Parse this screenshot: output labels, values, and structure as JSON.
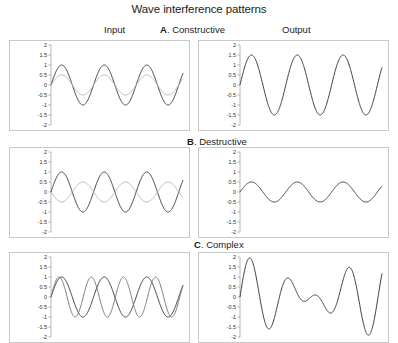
{
  "figure": {
    "title": "Wave interference patterns"
  },
  "headers": {
    "input": "Input",
    "output": "Output"
  },
  "panels": [
    {
      "id": "a",
      "letter": "A",
      "separator": ". ",
      "name": "Constructive"
    },
    {
      "id": "b",
      "letter": "B",
      "separator": ". ",
      "name": "Destructive"
    },
    {
      "id": "c",
      "letter": "C",
      "separator": ". ",
      "name": "Complex"
    }
  ],
  "colors": {
    "wave_dark": "#3d3d3d",
    "wave_light": "#b8b8b8",
    "frame": "#c9c9c9",
    "axis": "#9a9a9a",
    "background": "#ffffff",
    "text": "#1c1c1c"
  },
  "chart_data": [
    {
      "type": "line",
      "title": "A. Constructive — Input",
      "panel": "A",
      "column": "Input",
      "xlabel": "",
      "ylabel": "",
      "ylim": [
        -2,
        2
      ],
      "yticks": [
        2,
        1.5,
        1,
        0.5,
        0,
        -0.5,
        -1,
        -1.5,
        -2
      ],
      "ytick_labels": [
        "2",
        "1.5",
        "1",
        "0.5",
        "0",
        "-0.5",
        "-1",
        "-1.5",
        "-2"
      ],
      "grid": false,
      "legend": "none",
      "xlim": [
        0,
        3.1
      ],
      "series": [
        {
          "name": "wave 1",
          "color": "#3d3d3d",
          "form": "sine",
          "amplitude": 1,
          "cycles": 3.1,
          "phase_deg": 0
        },
        {
          "name": "wave 2",
          "color": "#b8b8b8",
          "form": "sine",
          "amplitude": 0.5,
          "cycles": 3.1,
          "phase_deg": 0
        }
      ]
    },
    {
      "type": "line",
      "title": "A. Constructive — Output",
      "panel": "A",
      "column": "Output",
      "xlabel": "",
      "ylabel": "",
      "ylim": [
        -2,
        2
      ],
      "yticks": [
        2,
        1.5,
        1,
        0.5,
        0,
        -0.5,
        -1,
        -1.5,
        -2
      ],
      "ytick_labels": [
        "2",
        "1.5",
        "1",
        "0.5",
        "0",
        "-0.5",
        "-1",
        "-1.5",
        "-2"
      ],
      "grid": false,
      "legend": "none",
      "xlim": [
        0,
        3.1
      ],
      "series": [
        {
          "name": "sum",
          "color": "#3d3d3d",
          "form": "sine",
          "amplitude": 1.5,
          "cycles": 3.1,
          "phase_deg": 0
        }
      ]
    },
    {
      "type": "line",
      "title": "B. Destructive — Input",
      "panel": "B",
      "column": "Input",
      "xlabel": "",
      "ylabel": "",
      "ylim": [
        -2,
        2
      ],
      "yticks": [
        2,
        1.5,
        1,
        0.5,
        0,
        -0.5,
        -1,
        -1.5,
        -2
      ],
      "ytick_labels": [
        "2",
        "1.5",
        "1",
        "0.5",
        "0",
        "-0.5",
        "-1",
        "-1.5",
        "-2"
      ],
      "grid": false,
      "legend": "none",
      "xlim": [
        0,
        3.1
      ],
      "series": [
        {
          "name": "wave 1",
          "color": "#3d3d3d",
          "form": "sine",
          "amplitude": 1,
          "cycles": 3.1,
          "phase_deg": 0
        },
        {
          "name": "wave 2",
          "color": "#b8b8b8",
          "form": "sine",
          "amplitude": 0.5,
          "cycles": 3.1,
          "phase_deg": 180
        }
      ]
    },
    {
      "type": "line",
      "title": "B. Destructive — Output",
      "panel": "B",
      "column": "Output",
      "xlabel": "",
      "ylabel": "",
      "ylim": [
        -2,
        2
      ],
      "yticks": [
        2,
        1.5,
        1,
        0.5,
        0,
        -0.5,
        -1,
        -1.5,
        -2
      ],
      "ytick_labels": [
        "2",
        "1.5",
        "1",
        "0.5",
        "0",
        "-0.5",
        "-1",
        "-1.5",
        "-2"
      ],
      "grid": false,
      "legend": "none",
      "xlim": [
        0,
        3.1
      ],
      "series": [
        {
          "name": "sum",
          "color": "#3d3d3d",
          "form": "sine",
          "amplitude": 0.5,
          "cycles": 3.1,
          "phase_deg": 0
        }
      ]
    },
    {
      "type": "line",
      "title": "C. Complex — Input",
      "panel": "C",
      "column": "Input",
      "xlabel": "",
      "ylabel": "",
      "ylim": [
        -2,
        2
      ],
      "yticks": [
        2,
        1.5,
        1,
        0.5,
        0,
        -0.5,
        -1,
        -1.5,
        -2
      ],
      "ytick_labels": [
        "2",
        "1.5",
        "1",
        "0.5",
        "0",
        "-0.5",
        "-1",
        "-1.5",
        "-2"
      ],
      "grid": false,
      "legend": "none",
      "xlim": [
        0,
        3.1
      ],
      "series": [
        {
          "name": "wave 1",
          "color": "#3d3d3d",
          "form": "sine",
          "amplitude": 1,
          "cycles": 3.1,
          "phase_deg": 0
        },
        {
          "name": "wave 2",
          "color": "#7a7a7a",
          "form": "sine",
          "amplitude": 1,
          "cycles": 4.1,
          "phase_deg": 0
        }
      ]
    },
    {
      "type": "line",
      "title": "C. Complex — Output",
      "panel": "C",
      "column": "Output",
      "xlabel": "",
      "ylabel": "",
      "ylim": [
        -2,
        2
      ],
      "yticks": [
        2,
        1.5,
        1,
        0.5,
        0,
        -0.5,
        -1,
        -1.5,
        -2
      ],
      "ytick_labels": [
        "2",
        "1.5",
        "1",
        "0.5",
        "0",
        "-0.5",
        "-1",
        "-1.5",
        "-2"
      ],
      "grid": false,
      "legend": "none",
      "xlim": [
        0,
        3.1
      ],
      "series": [
        {
          "name": "sum",
          "color": "#3d3d3d",
          "form": "sum-of-sines",
          "components": [
            {
              "amplitude": 1,
              "cycles": 3.1,
              "phase_deg": 0
            },
            {
              "amplitude": 1,
              "cycles": 4.1,
              "phase_deg": 0
            }
          ]
        }
      ]
    }
  ]
}
